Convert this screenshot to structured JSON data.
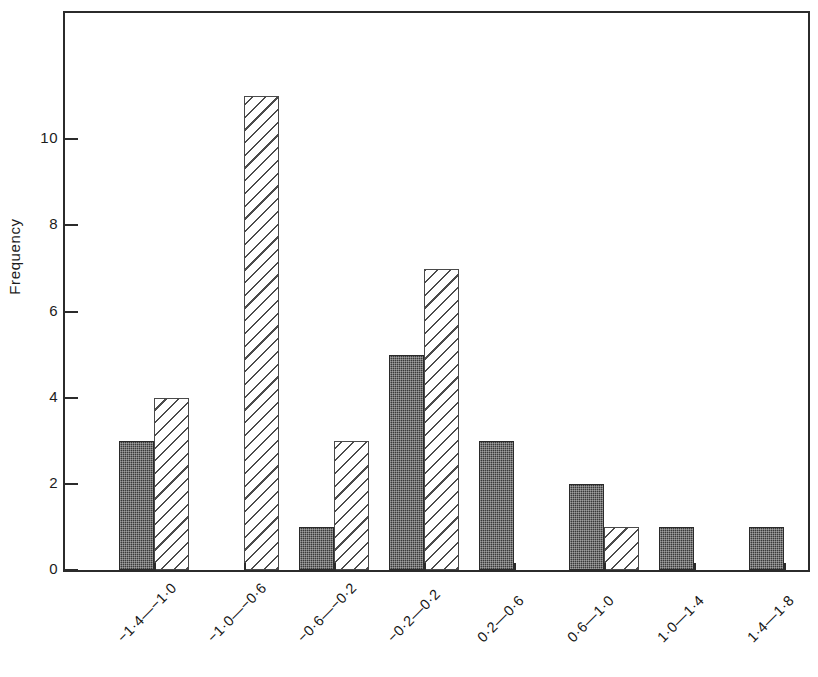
{
  "chart_data": {
    "type": "bar",
    "title": "",
    "subtitle": "",
    "xlabel": "",
    "ylabel": "Frequency",
    "categories": [
      "−1·4—−1·0",
      "−1·0—−0·6",
      "−0·6—−0·2",
      "−0·2—0·2",
      "0·2—0·6",
      "0·6—1·0",
      "1·0—1·4",
      "1·4—1·8"
    ],
    "series": [
      {
        "name": "solid-stippled",
        "fill": "dark",
        "values": [
          3,
          0,
          1,
          5,
          3,
          2,
          1,
          1
        ]
      },
      {
        "name": "diagonal-hatched",
        "fill": "hatch",
        "values": [
          4,
          11,
          3,
          7,
          0,
          1,
          0,
          0
        ]
      }
    ],
    "ylim": [
      0,
      13.025
    ],
    "yticks": [
      0,
      2,
      4,
      6,
      8,
      10
    ],
    "ytick_labels": [
      "0",
      "2",
      "4",
      "6",
      "8",
      "10"
    ],
    "grid": false,
    "legend": "none",
    "axis_color": "#2b2b2b",
    "background": "#ffffff"
  },
  "figure": {
    "ylabel": "Frequency"
  }
}
